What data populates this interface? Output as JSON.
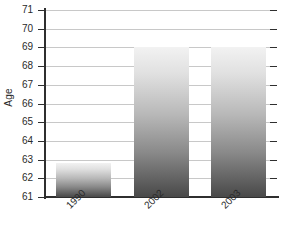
{
  "chart_data": {
    "type": "bar",
    "title": "",
    "xlabel": "",
    "ylabel": "Age",
    "categories": [
      "1990",
      "2002",
      "2003"
    ],
    "values": [
      62.8,
      69.0,
      69.0
    ],
    "ylim": [
      61,
      71
    ],
    "ytick_labels": [
      "71",
      "70",
      "69",
      "68",
      "67",
      "66",
      "65",
      "64",
      "63",
      "62",
      "61"
    ],
    "ytick_values": [
      71,
      70,
      69,
      68,
      67,
      66,
      65,
      64,
      63,
      62,
      61
    ],
    "grid": true,
    "legend": "none",
    "bar_style": "vertical-gradient-grayscale",
    "xtick_rotation": -45,
    "colors": {
      "axis": "#2f2f2f",
      "gridline": "#c8c8c8",
      "bar_top": "#f2f2f2",
      "bar_bottom": "#494949",
      "background": "#ffffff",
      "text": "#2a2a2a"
    }
  }
}
